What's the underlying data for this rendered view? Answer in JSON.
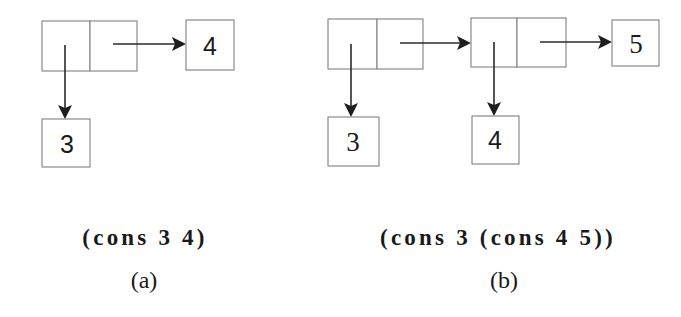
{
  "diagram_a": {
    "expression": "(cons 3 4)",
    "label": "(a)",
    "cons_cells": 1,
    "car_atom": "3",
    "cdr_atom": "4"
  },
  "diagram_b": {
    "expression": "(cons 3 (cons 4 5))",
    "label": "(b)",
    "cons_cells": 2,
    "first_car_atom": "3",
    "second_car_atom": "4",
    "second_cdr_atom": "5"
  },
  "colors": {
    "box_stroke": "#8a8a8a",
    "arrow": "#2a2a2a",
    "text": "#1a1a1a",
    "background": "#ffffff"
  }
}
